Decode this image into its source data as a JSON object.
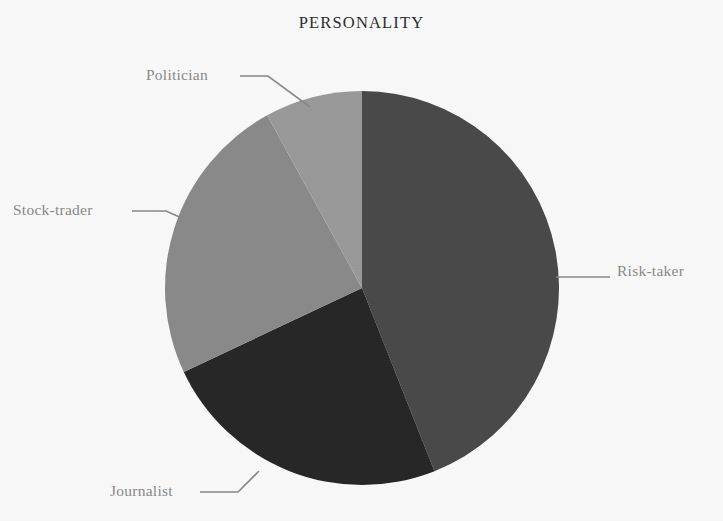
{
  "chart_data": {
    "type": "pie",
    "title": "PERSONALITY",
    "xlabel": "",
    "ylabel": "",
    "grid": false,
    "legend_position": "none",
    "labels_position": "outside-with-leader-lines",
    "start_angle_deg": 0,
    "direction": "clockwise",
    "categories": [
      "Risk-taker",
      "Journalist",
      "Stock-trader",
      "Politician"
    ],
    "values": [
      44,
      24,
      24,
      8
    ],
    "units": "percent",
    "slices": [
      {
        "label": "Risk-taker",
        "value": 44,
        "color": "#4b4b4b",
        "start_angle_deg": 0,
        "end_angle_deg": 158.4
      },
      {
        "label": "Journalist",
        "value": 24,
        "color": "#282828",
        "start_angle_deg": 158.4,
        "end_angle_deg": 244.8
      },
      {
        "label": "Stock-trader",
        "value": 24,
        "color": "#8c8c8c",
        "start_angle_deg": 244.8,
        "end_angle_deg": 331.2
      },
      {
        "label": "Politician",
        "value": 8,
        "color": "#9c9c9c",
        "start_angle_deg": 331.2,
        "end_angle_deg": 360
      }
    ],
    "annotations": [],
    "geometry": {
      "center_x": 362,
      "center_y": 288,
      "radius": 197
    }
  },
  "labels": {
    "politician": "Politician",
    "stock_trader": "Stock-trader",
    "journalist": "Journalist",
    "risk_taker": "Risk-taker"
  },
  "colors": {
    "background": "#fdfdfd",
    "title_text": "#2d2d2d",
    "label_text": "#8b8b8b",
    "leader_line": "#8b8b8b",
    "slice_risk_taker": "#4b4b4b",
    "slice_journalist": "#282828",
    "slice_stock_trader": "#8c8c8c",
    "slice_politician": "#9c9c9c"
  }
}
